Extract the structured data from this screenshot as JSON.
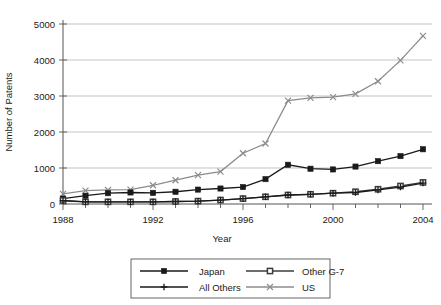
{
  "chart_data": {
    "type": "line",
    "title": "",
    "xlabel": "Year",
    "ylabel": "Number of Patents",
    "xlim": [
      1988,
      2004
    ],
    "ylim": [
      0,
      5000
    ],
    "yticks": [
      0,
      1000,
      2000,
      3000,
      4000,
      5000
    ],
    "xticks": [
      1988,
      1992,
      1996,
      2000,
      2004
    ],
    "xtick_labels": [
      "1988",
      "1992",
      "1996",
      "2000",
      "2004"
    ],
    "ytick_labels": [
      "0",
      "1000",
      "2000",
      "3000",
      "4000",
      "5000"
    ],
    "grid": "horizontal",
    "legend_position": "below-center",
    "x": [
      1988,
      1989,
      1990,
      1991,
      1992,
      1993,
      1994,
      1995,
      1996,
      1997,
      1998,
      1999,
      2000,
      2001,
      2002,
      2003,
      2004
    ],
    "series": [
      {
        "name": "Japan",
        "marker": "filled-square",
        "color": "#1a1a1a",
        "values": [
          150,
          230,
          300,
          320,
          310,
          340,
          400,
          430,
          470,
          690,
          1090,
          980,
          960,
          1040,
          1190,
          1330,
          1520
        ]
      },
      {
        "name": "Other G-7",
        "marker": "open-square",
        "color": "#3c3c3c",
        "values": [
          100,
          60,
          60,
          60,
          60,
          70,
          80,
          110,
          150,
          200,
          250,
          270,
          300,
          340,
          410,
          500,
          600
        ]
      },
      {
        "name": "All Others",
        "marker": "plus",
        "color": "#1a1a1a",
        "values": [
          90,
          60,
          60,
          60,
          60,
          70,
          80,
          110,
          150,
          200,
          250,
          270,
          300,
          320,
          390,
          470,
          580
        ]
      },
      {
        "name": "US",
        "marker": "x",
        "color": "#8c8c8c",
        "values": [
          280,
          370,
          390,
          400,
          520,
          660,
          800,
          900,
          1410,
          1680,
          2870,
          2950,
          2970,
          3060,
          3410,
          3990,
          4670
        ]
      }
    ]
  },
  "legend": {
    "entries": [
      {
        "label": "Japan"
      },
      {
        "label": "Other G-7"
      },
      {
        "label": "All Others"
      },
      {
        "label": "US"
      }
    ]
  }
}
